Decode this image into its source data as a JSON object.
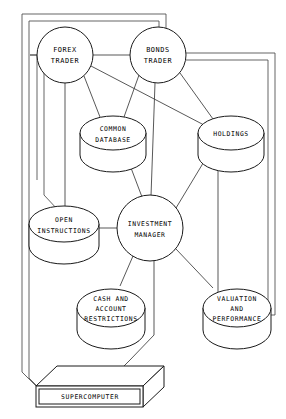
{
  "diagram": {
    "style": "technical line illustration, black on white",
    "colors": {
      "stroke": "#1a1a1a",
      "link": "#3a3a3a",
      "background": "#ffffff"
    },
    "nodes": [
      {
        "id": "forex_trader",
        "type": "circle",
        "lines": [
          "FOREX",
          "TRADER"
        ],
        "cx": 65,
        "cy": 55,
        "r": 28
      },
      {
        "id": "bonds_trader",
        "type": "circle",
        "lines": [
          "BONDS",
          "TRADER"
        ],
        "cx": 158,
        "cy": 55,
        "r": 28
      },
      {
        "id": "common_database",
        "type": "cylinder",
        "lines": [
          "COMMON",
          "DATABASE"
        ],
        "cx": 113,
        "cy": 133,
        "rx": 33,
        "ry": 17
      },
      {
        "id": "holdings",
        "type": "cylinder",
        "lines": [
          "HOLDINGS"
        ],
        "cx": 231,
        "cy": 133,
        "rx": 33,
        "ry": 17
      },
      {
        "id": "open_instructions",
        "type": "cylinder",
        "lines": [
          "OPEN",
          "INSTRUCTIONS"
        ],
        "cx": 64,
        "cy": 224,
        "rx": 35,
        "ry": 18
      },
      {
        "id": "investment_manager",
        "type": "circle",
        "lines": [
          "INVESTMENT",
          "MANAGER"
        ],
        "cx": 150,
        "cy": 228,
        "r": 33
      },
      {
        "id": "cash_account_restrictions",
        "type": "cylinder",
        "lines": [
          "CASH AND",
          "ACCOUNT",
          "RESTRICTIONS"
        ],
        "cx": 111,
        "cy": 308,
        "rx": 34,
        "ry": 19
      },
      {
        "id": "valuation_performance",
        "type": "cylinder",
        "lines": [
          "VALUATION",
          "AND",
          "PERFORMANCE"
        ],
        "cx": 237,
        "cy": 308,
        "rx": 34,
        "ry": 19
      },
      {
        "id": "supercomputer",
        "type": "box3d",
        "lines": [
          "SUPERCOMPUTER"
        ],
        "x": 36,
        "y": 372,
        "w": 107,
        "h": 28
      }
    ],
    "edges": [
      {
        "from": "forex_trader",
        "to": "bonds_trader"
      },
      {
        "from": "forex_trader",
        "to": "common_database"
      },
      {
        "from": "forex_trader",
        "to": "open_instructions"
      },
      {
        "from": "forex_trader",
        "to": "holdings"
      },
      {
        "from": "bonds_trader",
        "to": "common_database"
      },
      {
        "from": "bonds_trader",
        "to": "holdings"
      },
      {
        "from": "bonds_trader",
        "to": "investment_manager"
      },
      {
        "from": "common_database",
        "to": "investment_manager"
      },
      {
        "from": "holdings",
        "to": "valuation_performance"
      },
      {
        "from": "holdings",
        "to": "investment_manager"
      },
      {
        "from": "open_instructions",
        "to": "investment_manager"
      },
      {
        "from": "investment_manager",
        "to": "cash_account_restrictions"
      },
      {
        "from": "investment_manager",
        "to": "valuation_performance"
      },
      {
        "from": "investment_manager",
        "to": "supercomputer"
      },
      {
        "from": "supercomputer",
        "to": "forex_trader",
        "routing": "outer-left"
      },
      {
        "from": "supercomputer",
        "to": "bonds_trader",
        "routing": "outer-left-top"
      },
      {
        "from": "supercomputer",
        "to": "open_instructions",
        "routing": "outer-left"
      },
      {
        "from": "bonds_trader",
        "to": "valuation_performance",
        "routing": "outer-right"
      }
    ]
  }
}
